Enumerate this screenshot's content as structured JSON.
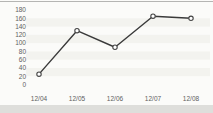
{
  "chart_data": {
    "type": "line",
    "categories": [
      "12/04",
      "12/05",
      "12/06",
      "12/07",
      "12/08"
    ],
    "values": [
      25,
      130,
      90,
      165,
      160
    ],
    "title": "",
    "xlabel": "",
    "ylabel": "",
    "ylim": [
      0,
      180
    ],
    "y_ticks": [
      0,
      20,
      40,
      60,
      80,
      100,
      120,
      140,
      160,
      180
    ],
    "grid": "faint horizontal row bands",
    "legend": "none",
    "marker": "open-circle"
  },
  "colors": {
    "background": "#fbfbf9",
    "band": "#f3f3ef",
    "line": "#3a3a3a",
    "marker_fill": "#ffffff",
    "marker_stroke": "#444444",
    "tick_text": "#606060",
    "top_divider": "#b5b5b3",
    "bottom_band": "#dededb"
  }
}
